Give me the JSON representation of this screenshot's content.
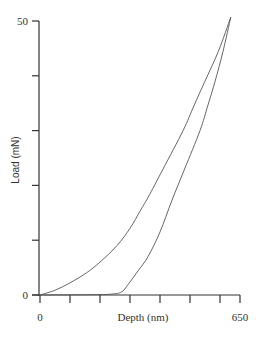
{
  "chart_data": {
    "type": "line",
    "title": "",
    "xlabel": "Depth (nm)",
    "ylabel": "Load  (mN)",
    "xlim": [
      0,
      650
    ],
    "ylim": [
      0,
      50
    ],
    "x_tick_labels": [
      {
        "value": 0,
        "label": "0"
      },
      {
        "value": 650,
        "label": "650"
      }
    ],
    "x_ticks": [
      0,
      97.5,
      195,
      292.5,
      390,
      487.5,
      585,
      650
    ],
    "y_tick_labels": [
      {
        "value": 0,
        "label": "0"
      },
      {
        "value": 50,
        "label": "50"
      }
    ],
    "y_ticks": [
      0,
      10,
      20,
      30,
      40,
      50
    ],
    "grid": false,
    "legend": "none",
    "series": [
      {
        "name": "loading",
        "x": [
          0,
          50,
          97,
          150,
          195,
          250,
          293,
          325,
          351,
          400,
          465,
          500,
          536,
          580,
          620
        ],
        "y": [
          0,
          0.9,
          2.2,
          4.0,
          6.0,
          9.0,
          12.2,
          15.3,
          17.8,
          23.0,
          30.0,
          34.5,
          39.0,
          44.5,
          50.7
        ]
      },
      {
        "name": "unloading",
        "x": [
          0,
          150,
          230,
          266,
          290,
          320,
          351,
          390,
          429,
          470,
          520,
          545,
          569,
          595,
          620
        ],
        "y": [
          0,
          0.05,
          0.15,
          0.6,
          2.2,
          4.5,
          7.0,
          11.5,
          17.3,
          23.0,
          30.0,
          34.5,
          39.0,
          44.5,
          50.7
        ]
      }
    ]
  }
}
